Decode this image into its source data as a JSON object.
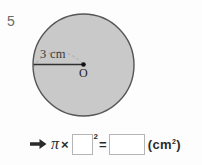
{
  "problem": {
    "number": "5"
  },
  "figure": {
    "shape": "circle",
    "fill_color": "#c9c9c9",
    "stroke_color": "#555555",
    "radius_label": "3 cm",
    "radius_value": 3,
    "radius_unit": "cm",
    "center_label": "O",
    "dashed_guide": true
  },
  "equation": {
    "arrow_icon": "right-arrow-icon",
    "pi_symbol": "π",
    "times_symbol": "×",
    "equals_symbol": "=",
    "exponent": "2",
    "radius_input_value": "",
    "radius_input_placeholder": "",
    "area_input_value": "",
    "area_input_placeholder": "",
    "unit_text": "(cm",
    "unit_exponent": "2",
    "unit_close": ")"
  },
  "colors": {
    "background": "#fdfdfd",
    "ink": "#2b2b2b",
    "box_border": "#b5b5b5",
    "number_gray": "#6b6b6b"
  }
}
